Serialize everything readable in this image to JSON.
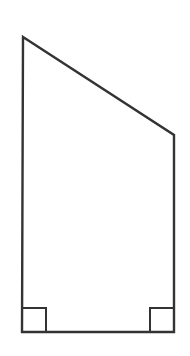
{
  "figure": {
    "background_color": "#ffffff",
    "stroke_color": "#333333",
    "outline": {
      "points": "23,37 174,135 174,332 22,332",
      "stroke_width": "2.4"
    },
    "markers": {
      "bottom_left": {
        "points": "22,308 46,308 46,332",
        "stroke_width": "2"
      },
      "bottom_right": {
        "points": "150,332 150,308 174,308",
        "stroke_width": "2"
      }
    }
  }
}
